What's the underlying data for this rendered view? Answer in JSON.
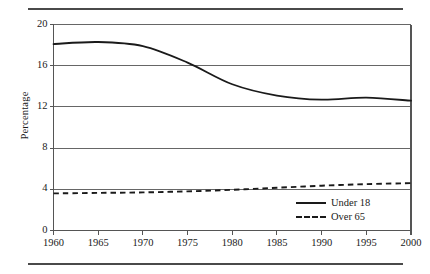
{
  "figure": {
    "has_top_rule": true,
    "has_bottom_rule": true,
    "rule_color": "#4a4a4a"
  },
  "chart_data": {
    "type": "line",
    "title": "",
    "subtitle": "",
    "xlabel": "",
    "ylabel": "Percentage",
    "x": [
      1960,
      1965,
      1970,
      1975,
      1980,
      1985,
      1990,
      1995,
      2000
    ],
    "xtick_labels": [
      "1960",
      "1965",
      "1970",
      "1975",
      "1980",
      "1985",
      "1990",
      "1995",
      "2000"
    ],
    "ytick_labels": [
      "0",
      "4",
      "8",
      "12",
      "16",
      "20"
    ],
    "yticks": [
      0,
      4,
      8,
      12,
      16,
      20
    ],
    "xlim": [
      1960,
      2000
    ],
    "ylim": [
      0,
      20
    ],
    "grid": "horizontal",
    "legend_position": "bottom-right",
    "series": [
      {
        "name": "Under 18",
        "style": "solid",
        "color": "#1a1a1a",
        "values": [
          18.1,
          18.3,
          17.9,
          16.3,
          14.2,
          13.1,
          12.7,
          12.9,
          12.6
        ]
      },
      {
        "name": "Over 65",
        "style": "dashed",
        "color": "#1a1a1a",
        "values": [
          3.6,
          3.65,
          3.7,
          3.8,
          3.95,
          4.15,
          4.35,
          4.5,
          4.6
        ]
      }
    ]
  }
}
